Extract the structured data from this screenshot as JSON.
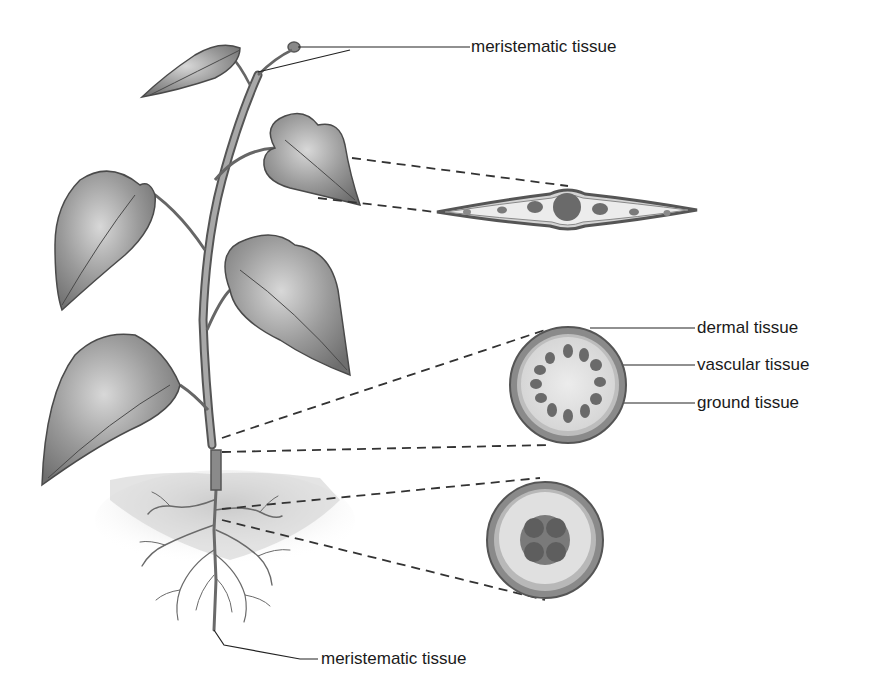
{
  "diagram": {
    "labels": {
      "meristematic_top": "meristematic tissue",
      "dermal": "dermal tissue",
      "vascular": "vascular tissue",
      "ground": "ground tissue",
      "meristematic_bottom": "meristematic tissue"
    },
    "colors": {
      "ink": "#3a3a3a",
      "leaf": "#8c8c8c",
      "leaf_light": "#c4c4c4",
      "dermal": "#7a7a7a",
      "ground": "#e2e2e2",
      "vascular": "#6a6a6a",
      "soil": "#d6d6d6"
    },
    "parts": {
      "plant": "whole plant with stem, heart-shaped leaves and roots",
      "leaf_cross_section": "leaf cross section with central vascular bundle and smaller bundles",
      "stem_cross_section": "stem cross section with ring of vascular bundles",
      "root_cross_section": "root cross section with X-shaped central vascular core"
    }
  }
}
